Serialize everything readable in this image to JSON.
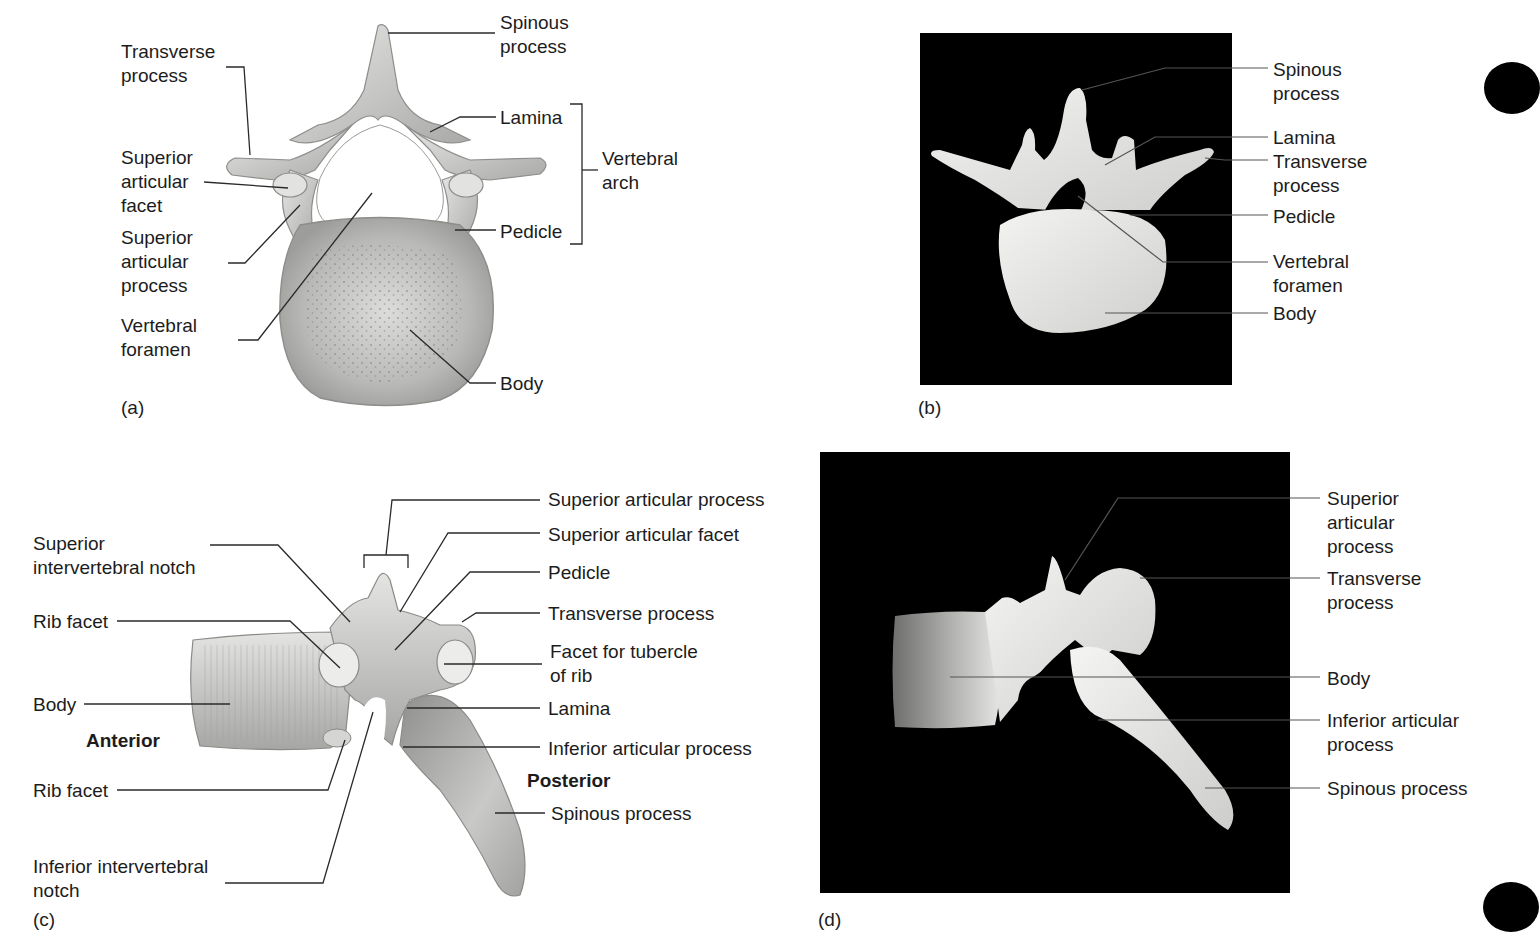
{
  "figure": {
    "panels": [
      {
        "id": "a",
        "letter": "(a)",
        "view": "superior view illustration",
        "labels": {
          "transverse_process": "Transverse\nprocess",
          "spinous_process": "Spinous\nprocess",
          "lamina": "Lamina",
          "vertebral_arch": "Vertebral\narch",
          "superior_articular_facet": "Superior\narticular\nfacet",
          "superior_articular_process": "Superior\narticular\nprocess",
          "pedicle": "Pedicle",
          "vertebral_foramen": "Vertebral\nforamen",
          "body": "Body"
        }
      },
      {
        "id": "b",
        "letter": "(b)",
        "view": "superior view photograph",
        "labels": {
          "spinous_process": "Spinous\nprocess",
          "lamina": "Lamina",
          "transverse_process": "Transverse\nprocess",
          "pedicle": "Pedicle",
          "vertebral_foramen": "Vertebral\nforamen",
          "body": "Body"
        }
      },
      {
        "id": "c",
        "letter": "(c)",
        "view": "lateral view illustration",
        "labels": {
          "superior_intervertebral_notch": "Superior\nintervertebral notch",
          "rib_facet_upper": "Rib facet",
          "body": "Body",
          "anterior": "Anterior",
          "rib_facet_lower": "Rib facet",
          "inferior_intervertebral_notch": "Inferior intervertebral\nnotch",
          "superior_articular_process": "Superior articular process",
          "superior_articular_facet": "Superior articular facet",
          "pedicle": "Pedicle",
          "transverse_process": "Transverse process",
          "facet_for_tubercle_of_rib": "Facet for tubercle\nof rib",
          "lamina": "Lamina",
          "inferior_articular_process": "Inferior articular process",
          "posterior": "Posterior",
          "spinous_process": "Spinous process"
        }
      },
      {
        "id": "d",
        "letter": "(d)",
        "view": "lateral view photograph",
        "labels": {
          "superior_articular_process": "Superior\narticular\nprocess",
          "transverse_process": "Transverse\nprocess",
          "body": "Body",
          "inferior_articular_process": "Inferior articular\nprocess",
          "spinous_process": "Spinous process"
        }
      }
    ],
    "colors": {
      "bone_light": "#e8e8e6",
      "bone_mid": "#bdbdbb",
      "bone_dark": "#8a8a88",
      "photo_bg": "#000000",
      "leader_line": "#2a2a2a"
    }
  }
}
